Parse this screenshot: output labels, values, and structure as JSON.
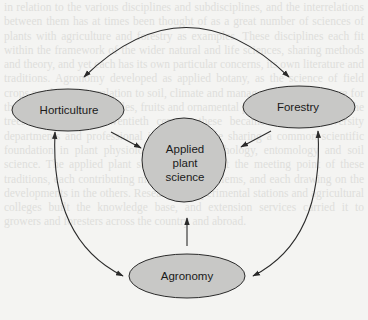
{
  "diagram": {
    "type": "concept-map",
    "center": {
      "id": "applied",
      "label_lines": [
        "Applied",
        "plant",
        "science"
      ]
    },
    "nodes": [
      {
        "id": "horticulture",
        "label": "Horticulture"
      },
      {
        "id": "forestry",
        "label": "Forestry"
      },
      {
        "id": "agronomy",
        "label": "Agronomy"
      }
    ],
    "edges": [
      {
        "from": "horticulture",
        "to": "forestry",
        "bidirectional": true
      },
      {
        "from": "horticulture",
        "to": "agronomy",
        "bidirectional": true
      },
      {
        "from": "forestry",
        "to": "agronomy",
        "bidirectional": true
      },
      {
        "from": "horticulture",
        "to": "applied"
      },
      {
        "from": "forestry",
        "to": "applied"
      },
      {
        "from": "agronomy",
        "to": "applied"
      }
    ],
    "colors": {
      "node_fill": "#c8c8c6",
      "stroke": "#2a2a2a",
      "background": "#f4f4f2"
    }
  },
  "background_text": "in relation to the various disciplines and subdisciplines, and the interrelations between them has at times been thought of as a great number of sciences of plants with agriculture and forestry as examples. These disciplines each fit within the framework of the wider natural and life sciences, sharing methods and theory, and yet each has its own particular concerns, its own literature and traditions. Agronomy developed as applied botany, as the science of field crops production in relation to soil, climate and management. Horticulture for the garden crops, vegetables, fruits and ornamental plants, and forestry for the trees. In the early twentieth century these became separate university departments and professional identities, while sharing a common scientific foundation in plant physiology, genetics, pathology, entomology and soil science. The applied plant sciences thus sit at the meeting point of these traditions, each contributing methods and problems, and each drawing on the developments in the others. Research at experimental stations and agricultural colleges built the knowledge base, and extension services carried it to growers and foresters across the country and abroad."
}
